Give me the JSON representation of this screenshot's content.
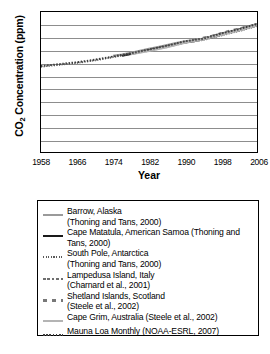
{
  "chart_data": {
    "type": "line",
    "title": "",
    "xlabel": "Year",
    "ylabel": "CO2 Concentration (ppm)",
    "ylabel_prefix": "CO",
    "ylabel_sub": "2",
    "ylabel_suffix": " Concentration (ppm)",
    "xlim": [
      1958,
      2006
    ],
    "ylim": [
      180,
      400
    ],
    "grid": true,
    "legend_position": "below-plot",
    "yticks": [
      400,
      380,
      360,
      340,
      320,
      300,
      280,
      260,
      240,
      220,
      200,
      180
    ],
    "xticks": [
      1958,
      1966,
      1974,
      1982,
      1990,
      1998,
      2006
    ],
    "x": [
      1958,
      1960,
      1962,
      1964,
      1966,
      1968,
      1970,
      1972,
      1974,
      1976,
      1978,
      1980,
      1982,
      1984,
      1986,
      1988,
      1990,
      1992,
      1994,
      1996,
      1998,
      2000,
      2002,
      2004,
      2006
    ],
    "series": [
      {
        "name": "Barrow, Alaska",
        "style": "solid-gray",
        "color": "#9a9a9a",
        "x": [
          1974,
          1976,
          1978,
          1980,
          1982,
          1984,
          1986,
          1988,
          1990,
          1992,
          1994,
          1996,
          1998,
          2000,
          2002,
          2004,
          2006
        ],
        "values": [
          331,
          333,
          336,
          339,
          342,
          345,
          348,
          351,
          354,
          356,
          358,
          362,
          366,
          369,
          373,
          377,
          381
        ]
      },
      {
        "name": "Cape Matatula, American Samoa",
        "style": "solid-black",
        "color": "#1a1a1a",
        "x": [
          1976,
          1978,
          1980,
          1982,
          1984,
          1986,
          1988,
          1990,
          1992,
          1994,
          1996,
          1998,
          2000,
          2002,
          2004,
          2006
        ],
        "values": [
          331,
          334,
          337,
          340,
          343,
          346,
          349,
          352,
          354,
          357,
          360,
          364,
          368,
          371,
          375,
          379
        ]
      },
      {
        "name": "South Pole, Antarctica",
        "style": "fine-dot",
        "color": "#5a5a5a",
        "x": [
          1958,
          1962,
          1966,
          1970,
          1974,
          1978,
          1982,
          1986,
          1990,
          1994,
          1998,
          2002,
          2006
        ],
        "values": [
          314,
          317,
          320,
          324,
          329,
          334,
          339,
          345,
          352,
          356,
          363,
          370,
          378
        ]
      },
      {
        "name": "Lampedusa Island, Italy",
        "style": "dash-dot",
        "color": "#6e6e6e",
        "x": [
          1992,
          1994,
          1996,
          1998,
          2000,
          2002,
          2004,
          2006
        ],
        "values": [
          356,
          358,
          362,
          366,
          369,
          373,
          377,
          381
        ]
      },
      {
        "name": "Shetland Islands, Scotland",
        "style": "sq-dash",
        "color": "#787878",
        "x": [
          1994,
          1996,
          1998,
          2000,
          2002,
          2004
        ],
        "values": [
          359,
          362,
          366,
          370,
          373,
          377
        ]
      },
      {
        "name": "Cape Grim, Australia",
        "style": "solid-ltgray",
        "color": "#b4b4b4",
        "x": [
          1978,
          1982,
          1986,
          1990,
          1994,
          1998,
          2002,
          2006
        ],
        "values": [
          334,
          339,
          345,
          352,
          357,
          364,
          371,
          379
        ]
      },
      {
        "name": "Mauna Loa Monthly",
        "style": "dotted",
        "color": "#3d3d3d",
        "x": [
          1958,
          1962,
          1966,
          1970,
          1974,
          1978,
          1982,
          1986,
          1990,
          1994,
          1998,
          2002,
          2006
        ],
        "values": [
          315,
          318,
          321,
          325,
          330,
          335,
          341,
          347,
          354,
          358,
          366,
          373,
          381
        ]
      }
    ]
  },
  "legend": {
    "items": [
      {
        "swatch": "solid-gray",
        "text": "Barrow, Alaska\n(Thoning and Tans, 2000)"
      },
      {
        "swatch": "solid-black",
        "text": "Cape Matatula, American Samoa (Thoning and Tans, 2000)"
      },
      {
        "swatch": "fine-dot",
        "text": "South Pole, Antarctica\n(Thoning and Tans, 2000)"
      },
      {
        "swatch": "dash-dot",
        "text": "Lampedusa Island, Italy\n(Charnard et al., 2001)"
      },
      {
        "swatch": "sq-dash",
        "text": "Shetland Islands, Scotland\n(Steele et al., 2002)"
      },
      {
        "swatch": "solid-ltgray",
        "text": "Cape Grim, Australia (Steele et al., 2002)"
      },
      {
        "swatch": "dotted",
        "text": "Mauna Loa Monthly (NOAA-ESRL, 2007)"
      }
    ]
  }
}
